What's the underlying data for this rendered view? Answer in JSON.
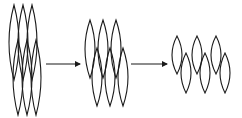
{
  "diagram": {
    "title": "",
    "stroke_color": "#1a1a1a",
    "background": "#ffffff",
    "stages": [
      {
        "id": "stage-1",
        "label": "",
        "top_row": {
          "centers_x": [
            14,
            23,
            32
          ],
          "y_top": 5,
          "y_bottom": 80,
          "half_width": 5
        },
        "bottom_row": {
          "centers_x": [
            18,
            27,
            36
          ],
          "y_top": 40,
          "y_bottom": 115,
          "half_width": 5
        }
      },
      {
        "id": "stage-2",
        "label": "",
        "top_row": {
          "centers_x": [
            90,
            103,
            116
          ],
          "y_top": 20,
          "y_bottom": 78,
          "half_width": 5
        },
        "bottom_row": {
          "centers_x": [
            97,
            110,
            123
          ],
          "y_top": 48,
          "y_bottom": 106,
          "half_width": 5
        }
      },
      {
        "id": "stage-3",
        "label": "",
        "top_row": {
          "centers_x": [
            177,
            197,
            216
          ],
          "y_top": 36,
          "y_bottom": 74,
          "half_width": 5
        },
        "bottom_row": {
          "centers_x": [
            186,
            205,
            225
          ],
          "y_top": 53,
          "y_bottom": 93,
          "half_width": 5
        }
      }
    ],
    "arrows": [
      {
        "id": "arrow-1",
        "from_x": 46,
        "to_x": 80,
        "y": 64
      },
      {
        "id": "arrow-2",
        "from_x": 131,
        "to_x": 167,
        "y": 64
      }
    ]
  }
}
